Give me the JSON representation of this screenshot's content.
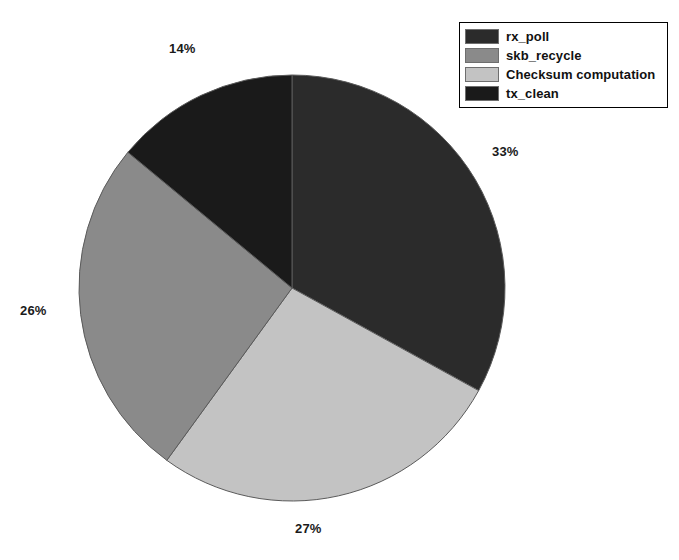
{
  "chart_data": {
    "type": "pie",
    "title": "",
    "categories": [
      "rx_poll",
      "skb_recycle",
      "Checksum computation",
      "tx_clean"
    ],
    "values": [
      33,
      26,
      27,
      14
    ],
    "value_unit": "%",
    "data_labels": [
      "33%",
      "26%",
      "27%",
      "14%"
    ],
    "legend_position": "top-right",
    "grid": false,
    "start_angle_deg": 0,
    "direction": "clockwise",
    "slices": [
      {
        "label": "rx_poll",
        "value": 33,
        "display": "33%",
        "color": "#2b2b2b",
        "start_deg": 0,
        "end_deg": 118.8,
        "label_x": 492,
        "label_y": 144
      },
      {
        "label": "Checksum computation",
        "value": 27,
        "display": "27%",
        "color": "#c3c3c3",
        "start_deg": 118.8,
        "end_deg": 216.0,
        "label_x": 295,
        "label_y": 521
      },
      {
        "label": "skb_recycle",
        "value": 26,
        "display": "26%",
        "color": "#8a8a8a",
        "start_deg": 216.0,
        "end_deg": 309.6,
        "label_x": 20,
        "label_y": 303
      },
      {
        "label": "tx_clean",
        "value": 14,
        "display": "14%",
        "color": "#1a1a1a",
        "start_deg": 309.6,
        "end_deg": 360.0,
        "label_x": 169,
        "label_y": 41
      }
    ],
    "geometry": {
      "center_x": 292,
      "center_y": 288,
      "radius": 213
    }
  },
  "legend": {
    "items": [
      {
        "label": "rx_poll",
        "color": "#2b2b2b"
      },
      {
        "label": "skb_recycle",
        "color": "#8a8a8a"
      },
      {
        "label": "Checksum computation",
        "color": "#c3c3c3"
      },
      {
        "label": "tx_clean",
        "color": "#1a1a1a"
      }
    ]
  },
  "canvas": {
    "background": "#ffffff"
  }
}
